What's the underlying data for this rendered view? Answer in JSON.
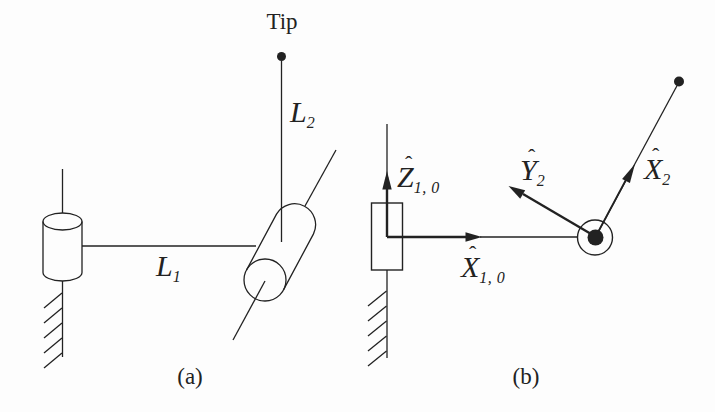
{
  "colors": {
    "ink": "#222222",
    "paper": "#fdfdfd"
  },
  "panel_a": {
    "caption": "(a)",
    "tip_label": "Tip",
    "link1_label": {
      "main": "L",
      "sub": "1"
    },
    "link2_label": {
      "main": "L",
      "sub": "2"
    }
  },
  "panel_b": {
    "caption": "(b)",
    "axis_labels": {
      "z10": {
        "hat": "ˆ",
        "main": "Z",
        "sub": "1, 0"
      },
      "x10": {
        "hat": "ˆ",
        "main": "X",
        "sub": "1, 0"
      },
      "y2": {
        "hat": "ˆ",
        "main": "Y",
        "sub": "2"
      },
      "x2": {
        "hat": "ˆ",
        "main": "X",
        "sub": "2"
      }
    }
  }
}
